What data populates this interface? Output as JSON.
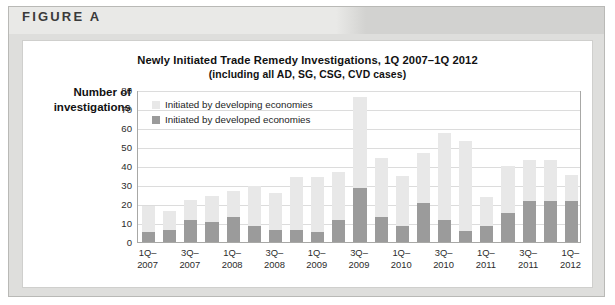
{
  "figure": {
    "label": "FIGURE A"
  },
  "chart_data": {
    "type": "bar",
    "title": "Newly Initiated Trade Remedy Investigations, 1Q 2007–1Q 2012",
    "subtitle": "(including all AD, SG, CSG, CVD cases)",
    "xlabel": "",
    "ylabel": "Number of investigations",
    "ylabel_line1": "Number of",
    "ylabel_line2": "investigations",
    "ylim": [
      0,
      80
    ],
    "ytick_labels": [
      "80",
      "70",
      "60",
      "50",
      "40",
      "30",
      "20",
      "10",
      "0"
    ],
    "yticks": [
      80,
      70,
      60,
      50,
      40,
      30,
      20,
      10,
      0
    ],
    "grid": true,
    "stacked": true,
    "legend_position": "top-left",
    "colors": {
      "developing": "#e8e8e8",
      "developed": "#9b9b9b",
      "frame": "#a8a8a6",
      "gridline": "#dcdcdc",
      "header_band": "#d2d2d0"
    },
    "categories": [
      "1Q-2007",
      "2Q-2007",
      "3Q-2007",
      "4Q-2007",
      "1Q-2008",
      "2Q-2008",
      "3Q-2008",
      "4Q-2008",
      "1Q-2009",
      "2Q-2009",
      "3Q-2009",
      "4Q-2009",
      "1Q-2010",
      "2Q-2010",
      "3Q-2010",
      "4Q-2010",
      "1Q-2011",
      "2Q-2011",
      "3Q-2011",
      "4Q-2011",
      "1Q-2012"
    ],
    "xtick_labels": [
      {
        "index": 0,
        "line1": "1Q–",
        "line2": "2007"
      },
      {
        "index": 2,
        "line1": "3Q–",
        "line2": "2007"
      },
      {
        "index": 4,
        "line1": "1Q–",
        "line2": "2008"
      },
      {
        "index": 6,
        "line1": "3Q–",
        "line2": "2008"
      },
      {
        "index": 8,
        "line1": "1Q–",
        "line2": "2009"
      },
      {
        "index": 10,
        "line1": "3Q–",
        "line2": "2009"
      },
      {
        "index": 12,
        "line1": "1Q–",
        "line2": "2010"
      },
      {
        "index": 14,
        "line1": "3Q–",
        "line2": "2010"
      },
      {
        "index": 16,
        "line1": "1Q–",
        "line2": "2011"
      },
      {
        "index": 18,
        "line1": "3Q–",
        "line2": "2011"
      },
      {
        "index": 20,
        "line1": "1Q–",
        "line2": "2012"
      }
    ],
    "series": [
      {
        "name": "Initiated by developed economies",
        "color": "#9b9b9b",
        "values": [
          5.5,
          6.5,
          11.5,
          10.5,
          13,
          8.5,
          6.5,
          6.5,
          5.5,
          11.5,
          28.5,
          13,
          8.5,
          20.5,
          11.5,
          6,
          8.5,
          15.5,
          21.5,
          21.5,
          21.5
        ]
      },
      {
        "name": "Initiated by developing economies",
        "color": "#e8e8e8",
        "values": [
          13.5,
          10,
          10.5,
          13.5,
          14,
          21,
          19.5,
          27.5,
          28.5,
          25.5,
          48,
          31,
          26,
          26.5,
          46,
          47,
          15,
          24.5,
          21.5,
          21.5,
          14
        ]
      }
    ],
    "totals": [
      19,
      16.5,
      22,
      24,
      27,
      29.5,
      26,
      34,
      34,
      37,
      76.5,
      44,
      34.5,
      47,
      57.5,
      53,
      23.5,
      40,
      43,
      43,
      35.5
    ]
  }
}
